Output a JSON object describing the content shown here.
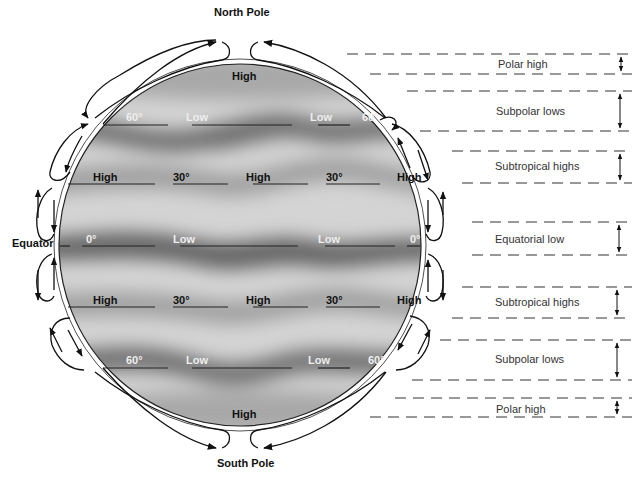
{
  "title_labels": {
    "north_pole": "North Pole",
    "south_pole": "South Pole",
    "equator": "Equator"
  },
  "globe_labels": {
    "north_polar": "High",
    "south_polar": "High",
    "lat_60n": {
      "lat": "60°",
      "low1": "Low",
      "low2": "Low",
      "lat_right": "60°"
    },
    "lat_30n": {
      "high1": "High",
      "lat": "30°",
      "high2": "High",
      "lat2": "30°",
      "high3": "High"
    },
    "lat_0": {
      "lat": "0°",
      "low1": "Low",
      "low2": "Low",
      "lat_right": "0°"
    },
    "lat_30s": {
      "high1": "High",
      "lat": "30°",
      "high2": "High",
      "lat2": "30°",
      "high3": "High"
    },
    "lat_60s": {
      "lat": "60°",
      "low1": "Low",
      "low2": "Low",
      "lat_right": "60°"
    }
  },
  "bands": [
    {
      "label": "Polar high"
    },
    {
      "label": "Subpolar lows"
    },
    {
      "label": "Subtropical highs"
    },
    {
      "label": "Equatorial low"
    },
    {
      "label": "Subtropical highs"
    },
    {
      "label": "Subpolar lows"
    },
    {
      "label": "Polar high"
    }
  ],
  "colors": {
    "light_zone": "#d8d8d8",
    "dark_zone": "#7a7a7a",
    "ink": "#111111"
  }
}
